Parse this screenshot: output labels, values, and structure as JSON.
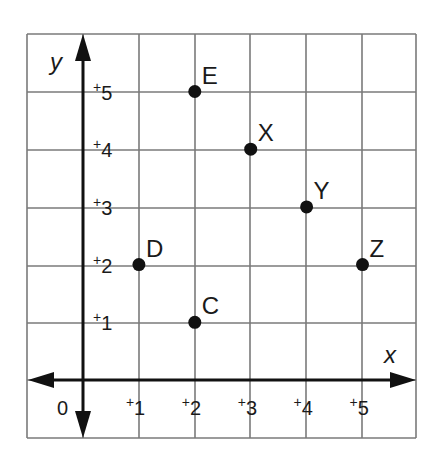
{
  "chart_data": {
    "type": "scatter",
    "title": "",
    "xlabel": "x",
    "ylabel": "y",
    "origin_label": "0",
    "xlim": [
      -1,
      6
    ],
    "ylim": [
      -1,
      6
    ],
    "grid": true,
    "x_ticks": [
      "+1",
      "+2",
      "+3",
      "+4",
      "+5"
    ],
    "y_ticks": [
      "+1",
      "+2",
      "+3",
      "+4",
      "+5"
    ],
    "points": [
      {
        "label": "C",
        "x": 2,
        "y": 1
      },
      {
        "label": "D",
        "x": 1,
        "y": 2
      },
      {
        "label": "E",
        "x": 2,
        "y": 5
      },
      {
        "label": "X",
        "x": 3,
        "y": 4
      },
      {
        "label": "Y",
        "x": 4,
        "y": 3
      },
      {
        "label": "Z",
        "x": 5,
        "y": 2
      }
    ],
    "colors": {
      "grid": "#7a7a7a",
      "axis": "#111111",
      "point": "#111111"
    }
  }
}
